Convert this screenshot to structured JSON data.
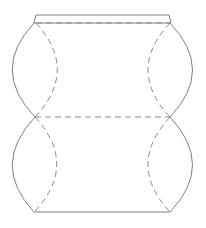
{
  "diagram": {
    "type": "pillow-box-template",
    "colors": {
      "background": "#ffffff",
      "cut_line": "#808080",
      "fold_line": "#8a8a8a"
    },
    "legend": {
      "solid": "cut line",
      "dashed": "fold line"
    },
    "shapes": {
      "top_flap": {
        "points": "36,15 169,15 171,23 34,23"
      },
      "top_fold": {
        "x1": 36,
        "y1": 23,
        "x2": 170,
        "y2": 23
      },
      "middle_fold": {
        "x1": 35,
        "y1": 117,
        "x2": 170,
        "y2": 117
      },
      "bottom_edge": {
        "x1": 34,
        "y1": 212,
        "x2": 170,
        "y2": 212
      },
      "upper_left_outer": "M34,23 Q-10,70 35,117",
      "upper_left_inner": "M36,23 Q79,70 35,117",
      "upper_right_outer": "M170,23 Q215,70 170,117",
      "upper_right_inner": "M170,23 Q126,70 170,117",
      "lower_left_outer": "M35,117 Q-10,165 34,212",
      "lower_left_inner": "M35,117 Q79,165 34,212",
      "lower_right_outer": "M170,117 Q215,165 170,212",
      "lower_right_inner": "M170,117 Q126,165 170,212"
    }
  }
}
